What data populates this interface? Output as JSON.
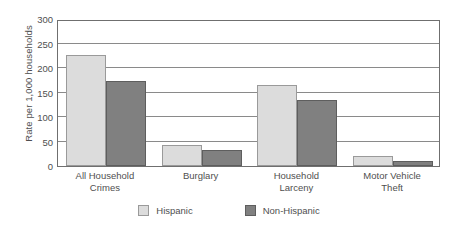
{
  "chart_data": {
    "type": "bar",
    "title": "",
    "subtitle": "",
    "xlabel": "",
    "ylabel": "Rate per 1,000 households",
    "ylim": [
      0,
      300
    ],
    "yticks": [
      0,
      50,
      100,
      150,
      200,
      250,
      300
    ],
    "ytick_labels": [
      "0",
      "50",
      "100",
      "150",
      "200",
      "250",
      "300"
    ],
    "grid": true,
    "legend_position": "bottom",
    "categories": [
      "All Household Crimes",
      "Burglary",
      "Household Larceny",
      "Motor Vehicle Theft"
    ],
    "category_lines": [
      [
        "All Household",
        "Crimes"
      ],
      [
        "Burglary",
        ""
      ],
      [
        "Household",
        "Larceny"
      ],
      [
        "Motor Vehicle",
        "Theft"
      ]
    ],
    "series": [
      {
        "name": "Hispanic",
        "color": "#dcdcdc",
        "values": [
          226,
          42,
          166,
          21
        ]
      },
      {
        "name": "Non-Hispanic",
        "color": "#808080",
        "values": [
          173,
          32,
          135,
          10
        ]
      }
    ]
  },
  "legend": {
    "items": [
      {
        "label": "Hispanic",
        "swatch": "hispanic"
      },
      {
        "label": "Non-Hispanic",
        "swatch": "nonhispanic"
      }
    ]
  },
  "colors": {
    "hispanic_fill": "#dcdcdc",
    "hispanic_border": "#9a9a9a",
    "nonhispanic_fill": "#808080",
    "nonhispanic_border": "#5e5e5e",
    "gridline": "#8a8a8a",
    "frame": "#6f6f6f",
    "text": "#4f4f4f",
    "background": "#ffffff"
  }
}
